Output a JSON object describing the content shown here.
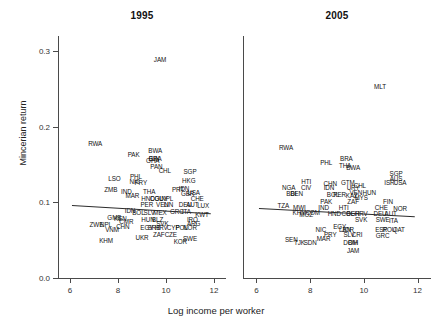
{
  "figure": {
    "xlabel": "Log income per worker",
    "ylabel": "Mincerian return",
    "xticks": [
      "6",
      "8",
      "10",
      "12"
    ],
    "yticks": [
      "0.0",
      "0.1",
      "0.2",
      "0.3"
    ]
  },
  "chart_data": {
    "type": "scatter",
    "title": "",
    "xlabel": "Log income per worker",
    "ylabel": "Mincerian return",
    "xlim": [
      5.5,
      12.5
    ],
    "ylim": [
      0.0,
      0.32
    ],
    "xticks": [
      6,
      8,
      10,
      12
    ],
    "yticks": [
      0.0,
      0.1,
      0.2,
      0.3
    ],
    "grid": false,
    "legend": "none",
    "panels": [
      {
        "label": "1995",
        "fit": {
          "type": "linear",
          "x0": 6.1,
          "y0": 0.097,
          "x1": 11.9,
          "y1": 0.086
        },
        "points": [
          {
            "label": "JAM",
            "x": 9.75,
            "y": 0.288
          },
          {
            "label": "RWA",
            "x": 7.05,
            "y": 0.177
          },
          {
            "label": "PAK",
            "x": 8.65,
            "y": 0.162
          },
          {
            "label": "BWA",
            "x": 9.55,
            "y": 0.168
          },
          {
            "label": "GIN",
            "x": 9.5,
            "y": 0.157
          },
          {
            "label": "BRA",
            "x": 9.55,
            "y": 0.157
          },
          {
            "label": "GHA",
            "x": 9.45,
            "y": 0.155
          },
          {
            "label": "PAN",
            "x": 9.6,
            "y": 0.147
          },
          {
            "label": "CHL",
            "x": 9.95,
            "y": 0.142
          },
          {
            "label": "SGP",
            "x": 11.0,
            "y": 0.14
          },
          {
            "label": "LSO",
            "x": 7.85,
            "y": 0.131
          },
          {
            "label": "PHL",
            "x": 8.75,
            "y": 0.133
          },
          {
            "label": "NIC",
            "x": 8.7,
            "y": 0.127
          },
          {
            "label": "PRY",
            "x": 8.95,
            "y": 0.125
          },
          {
            "label": "HKG",
            "x": 10.95,
            "y": 0.128
          },
          {
            "label": "ZMB",
            "x": 7.7,
            "y": 0.116
          },
          {
            "label": "IND",
            "x": 8.35,
            "y": 0.114
          },
          {
            "label": "THA",
            "x": 9.3,
            "y": 0.114
          },
          {
            "label": "PRT",
            "x": 10.5,
            "y": 0.117
          },
          {
            "label": "IDN",
            "x": 10.75,
            "y": 0.118
          },
          {
            "label": "USA",
            "x": 11.15,
            "y": 0.113
          },
          {
            "label": "GBR",
            "x": 10.9,
            "y": 0.111
          },
          {
            "label": "MAR",
            "x": 8.6,
            "y": 0.108
          },
          {
            "label": "HND",
            "x": 9.25,
            "y": 0.104
          },
          {
            "label": "COL",
            "x": 9.6,
            "y": 0.104
          },
          {
            "label": "GUY",
            "x": 9.8,
            "y": 0.104
          },
          {
            "label": "NPL",
            "x": 10.05,
            "y": 0.104
          },
          {
            "label": "CHE",
            "x": 11.3,
            "y": 0.104
          },
          {
            "label": "PER",
            "x": 9.2,
            "y": 0.096
          },
          {
            "label": "VEN",
            "x": 9.85,
            "y": 0.097
          },
          {
            "label": "LIN",
            "x": 10.1,
            "y": 0.097
          },
          {
            "label": "DEU",
            "x": 10.8,
            "y": 0.097
          },
          {
            "label": "AUT",
            "x": 11.1,
            "y": 0.096
          },
          {
            "label": "LUX",
            "x": 11.55,
            "y": 0.095
          },
          {
            "label": "IDN",
            "x": 8.5,
            "y": 0.088
          },
          {
            "label": "BOL",
            "x": 8.85,
            "y": 0.086
          },
          {
            "label": "SLV",
            "x": 9.3,
            "y": 0.086
          },
          {
            "label": "MEX",
            "x": 9.75,
            "y": 0.086
          },
          {
            "label": "GRC",
            "x": 10.45,
            "y": 0.087
          },
          {
            "label": "ITA",
            "x": 10.85,
            "y": 0.087
          },
          {
            "label": "KWT",
            "x": 11.5,
            "y": 0.083
          },
          {
            "label": "KEN",
            "x": 8.1,
            "y": 0.078
          },
          {
            "label": "GMB",
            "x": 7.85,
            "y": 0.08
          },
          {
            "label": "CMR",
            "x": 8.35,
            "y": 0.074
          },
          {
            "label": "ZWE",
            "x": 7.1,
            "y": 0.07
          },
          {
            "label": "NPL",
            "x": 7.5,
            "y": 0.07
          },
          {
            "label": "CHN",
            "x": 8.2,
            "y": 0.068
          },
          {
            "label": "VNM",
            "x": 7.75,
            "y": 0.064
          },
          {
            "label": "HUN",
            "x": 9.25,
            "y": 0.077
          },
          {
            "label": "BLZ",
            "x": 9.65,
            "y": 0.077
          },
          {
            "label": "SVK",
            "x": 9.85,
            "y": 0.072
          },
          {
            "label": "IRQ",
            "x": 11.1,
            "y": 0.077
          },
          {
            "label": "ARG",
            "x": 11.15,
            "y": 0.071
          },
          {
            "label": "EGY",
            "x": 9.2,
            "y": 0.066
          },
          {
            "label": "SRB",
            "x": 9.5,
            "y": 0.066
          },
          {
            "label": "HRV",
            "x": 9.8,
            "y": 0.066
          },
          {
            "label": "CYP",
            "x": 10.3,
            "y": 0.066
          },
          {
            "label": "POL",
            "x": 10.65,
            "y": 0.066
          },
          {
            "label": "NOR",
            "x": 11.0,
            "y": 0.066
          },
          {
            "label": "UKR",
            "x": 9.0,
            "y": 0.053
          },
          {
            "label": "ZAF",
            "x": 9.7,
            "y": 0.057
          },
          {
            "label": "CZE",
            "x": 10.2,
            "y": 0.057
          },
          {
            "label": "KHM",
            "x": 7.5,
            "y": 0.049
          },
          {
            "label": "KOR",
            "x": 10.6,
            "y": 0.047
          },
          {
            "label": "SWE",
            "x": 11.0,
            "y": 0.052
          }
        ]
      },
      {
        "label": "2005",
        "fit": {
          "type": "linear",
          "x0": 6.1,
          "y0": 0.092,
          "x1": 11.9,
          "y1": 0.081
        },
        "points": [
          {
            "label": "MLT",
            "x": 10.6,
            "y": 0.252
          },
          {
            "label": "RWA",
            "x": 7.1,
            "y": 0.172
          },
          {
            "label": "PHL",
            "x": 8.6,
            "y": 0.152
          },
          {
            "label": "BRA",
            "x": 9.35,
            "y": 0.157
          },
          {
            "label": "THA",
            "x": 9.3,
            "y": 0.148
          },
          {
            "label": "BWA",
            "x": 9.6,
            "y": 0.146
          },
          {
            "label": "SGP",
            "x": 11.2,
            "y": 0.137
          },
          {
            "label": "AUS",
            "x": 11.2,
            "y": 0.131
          },
          {
            "label": "HTI",
            "x": 7.85,
            "y": 0.127
          },
          {
            "label": "CHN",
            "x": 8.75,
            "y": 0.124
          },
          {
            "label": "GTM",
            "x": 9.4,
            "y": 0.126
          },
          {
            "label": "ISR",
            "x": 10.95,
            "y": 0.125
          },
          {
            "label": "USA",
            "x": 11.35,
            "y": 0.125
          },
          {
            "label": "NGA",
            "x": 7.2,
            "y": 0.119
          },
          {
            "label": "CIV",
            "x": 7.85,
            "y": 0.119
          },
          {
            "label": "IDN",
            "x": 8.7,
            "y": 0.119
          },
          {
            "label": "CHL",
            "x": 9.85,
            "y": 0.122
          },
          {
            "label": "URY",
            "x": 9.6,
            "y": 0.119
          },
          {
            "label": "VEN",
            "x": 9.7,
            "y": 0.113
          },
          {
            "label": "HUN",
            "x": 10.2,
            "y": 0.112
          },
          {
            "label": "BDI",
            "x": 7.3,
            "y": 0.111
          },
          {
            "label": "BEN",
            "x": 7.5,
            "y": 0.111
          },
          {
            "label": "BOL",
            "x": 8.85,
            "y": 0.11
          },
          {
            "label": "PER",
            "x": 9.1,
            "y": 0.11
          },
          {
            "label": "KAZ",
            "x": 9.55,
            "y": 0.108
          },
          {
            "label": "MYS",
            "x": 9.9,
            "y": 0.106
          },
          {
            "label": "PAK",
            "x": 8.6,
            "y": 0.101
          },
          {
            "label": "ZAF",
            "x": 9.6,
            "y": 0.101
          },
          {
            "label": "FIN",
            "x": 10.9,
            "y": 0.101
          },
          {
            "label": "TZA",
            "x": 7.0,
            "y": 0.095
          },
          {
            "label": "MWI",
            "x": 7.6,
            "y": 0.093
          },
          {
            "label": "IND",
            "x": 8.5,
            "y": 0.093
          },
          {
            "label": "HTI",
            "x": 9.25,
            "y": 0.093
          },
          {
            "label": "CHE",
            "x": 10.65,
            "y": 0.093
          },
          {
            "label": "NOR",
            "x": 11.35,
            "y": 0.091
          },
          {
            "label": "KHM",
            "x": 7.6,
            "y": 0.086
          },
          {
            "label": "COM",
            "x": 8.1,
            "y": 0.086
          },
          {
            "label": "HND",
            "x": 8.9,
            "y": 0.085
          },
          {
            "label": "COL",
            "x": 9.4,
            "y": 0.085
          },
          {
            "label": "BGR",
            "x": 9.6,
            "y": 0.085
          },
          {
            "label": "HRV",
            "x": 9.9,
            "y": 0.085
          },
          {
            "label": "DEU",
            "x": 10.6,
            "y": 0.085
          },
          {
            "label": "AUT",
            "x": 11.0,
            "y": 0.085
          },
          {
            "label": "MOZ",
            "x": 7.85,
            "y": 0.083
          },
          {
            "label": "SVK",
            "x": 9.9,
            "y": 0.077
          },
          {
            "label": "SWE",
            "x": 10.7,
            "y": 0.077
          },
          {
            "label": "ITA",
            "x": 11.1,
            "y": 0.076
          },
          {
            "label": "EGY",
            "x": 9.1,
            "y": 0.067
          },
          {
            "label": "NIC",
            "x": 8.4,
            "y": 0.063
          },
          {
            "label": "LBN",
            "x": 9.3,
            "y": 0.063
          },
          {
            "label": "JOR",
            "x": 9.4,
            "y": 0.063
          },
          {
            "label": "ESP",
            "x": 10.65,
            "y": 0.063
          },
          {
            "label": "ROU",
            "x": 10.95,
            "y": 0.063
          },
          {
            "label": "QAT",
            "x": 11.3,
            "y": 0.063
          },
          {
            "label": "PRY",
            "x": 8.75,
            "y": 0.057
          },
          {
            "label": "SLV",
            "x": 9.45,
            "y": 0.057
          },
          {
            "label": "CRI",
            "x": 9.75,
            "y": 0.057
          },
          {
            "label": "GRC",
            "x": 10.7,
            "y": 0.055
          },
          {
            "label": "SEN",
            "x": 7.3,
            "y": 0.05
          },
          {
            "label": "MAR",
            "x": 8.5,
            "y": 0.052
          },
          {
            "label": "TJK",
            "x": 7.6,
            "y": 0.046
          },
          {
            "label": "SDN",
            "x": 8.0,
            "y": 0.046
          },
          {
            "label": "DOM",
            "x": 9.5,
            "y": 0.046
          },
          {
            "label": "BIH",
            "x": 9.6,
            "y": 0.046
          },
          {
            "label": "JAM",
            "x": 9.6,
            "y": 0.036
          }
        ]
      }
    ]
  }
}
